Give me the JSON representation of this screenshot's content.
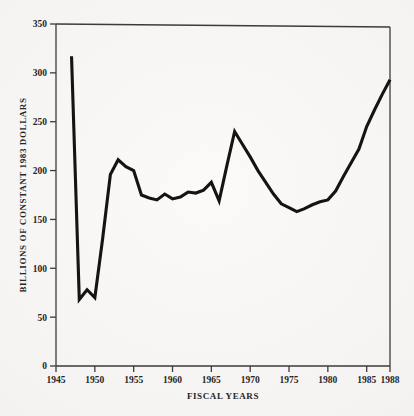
{
  "page": {
    "background_color": "#f2f1ef",
    "ink_color": "#141414"
  },
  "chart_data": {
    "type": "line",
    "title": "",
    "xlabel": "FISCAL YEARS",
    "ylabel": "BILLIONS OF CONSTANT 1983 DOLLARS",
    "xlim": [
      1945,
      1988
    ],
    "ylim": [
      0,
      350
    ],
    "grid": false,
    "legend": null,
    "xticks": [
      1945,
      1950,
      1955,
      1960,
      1965,
      1970,
      1975,
      1980,
      1985,
      1988
    ],
    "xtick_labels": [
      "1945",
      "1950",
      "1955",
      "1960",
      "1965",
      "1970",
      "1975",
      "1980",
      "1985",
      "1988"
    ],
    "yticks": [
      0,
      50,
      100,
      150,
      200,
      250,
      300,
      350
    ],
    "ytick_labels": [
      "0",
      "50",
      "100",
      "150",
      "200",
      "250",
      "300",
      "350"
    ],
    "series": [
      {
        "name": "Defense outlays",
        "color": "#141414",
        "x": [
          1947,
          1948,
          1949,
          1950,
          1951,
          1952,
          1953,
          1954,
          1955,
          1956,
          1957,
          1958,
          1959,
          1960,
          1961,
          1962,
          1963,
          1964,
          1965,
          1966,
          1967,
          1968,
          1969,
          1970,
          1971,
          1972,
          1973,
          1974,
          1975,
          1976,
          1977,
          1978,
          1979,
          1980,
          1981,
          1982,
          1983,
          1984,
          1985,
          1986,
          1987,
          1988
        ],
        "values": [
          317,
          68,
          78,
          70,
          130,
          196,
          211,
          204,
          200,
          175,
          172,
          170,
          176,
          171,
          173,
          178,
          177,
          180,
          188,
          169,
          205,
          240,
          227,
          214,
          200,
          188,
          176,
          166,
          162,
          158,
          161,
          165,
          168,
          170,
          179,
          194,
          208,
          222,
          245,
          262,
          278,
          293
        ]
      }
    ],
    "annotations": []
  }
}
